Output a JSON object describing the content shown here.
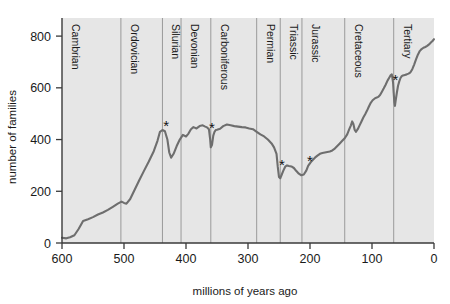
{
  "chart_data": {
    "type": "line",
    "title": "",
    "xlabel": "millions of years ago",
    "ylabel": "number of families",
    "xlim": [
      600,
      0
    ],
    "ylim": [
      0,
      870
    ],
    "x_reversed": true,
    "grid": false,
    "legend": null,
    "xticks": [
      600,
      500,
      400,
      300,
      200,
      100,
      0
    ],
    "xtick_labels": [
      "600",
      "500",
      "400",
      "300",
      "200",
      "100",
      "0"
    ],
    "yticks": [
      0,
      200,
      400,
      600,
      800
    ],
    "ytick_labels": [
      "0",
      "200",
      "400",
      "600",
      "800"
    ],
    "series": [
      {
        "name": "number of marine families",
        "color": "#6e6e6e",
        "points": [
          [
            600,
            20
          ],
          [
            593,
            18
          ],
          [
            587,
            22
          ],
          [
            580,
            30
          ],
          [
            573,
            55
          ],
          [
            566,
            85
          ],
          [
            558,
            92
          ],
          [
            550,
            100
          ],
          [
            542,
            110
          ],
          [
            534,
            118
          ],
          [
            526,
            128
          ],
          [
            518,
            140
          ],
          [
            510,
            152
          ],
          [
            504,
            160
          ],
          [
            500,
            155
          ],
          [
            496,
            152
          ],
          [
            490,
            170
          ],
          [
            483,
            205
          ],
          [
            476,
            240
          ],
          [
            468,
            278
          ],
          [
            460,
            315
          ],
          [
            452,
            355
          ],
          [
            446,
            395
          ],
          [
            442,
            430
          ],
          [
            438,
            437
          ],
          [
            434,
            432
          ],
          [
            430,
            400
          ],
          [
            427,
            350
          ],
          [
            424,
            330
          ],
          [
            420,
            345
          ],
          [
            415,
            375
          ],
          [
            410,
            400
          ],
          [
            405,
            418
          ],
          [
            400,
            412
          ],
          [
            396,
            423
          ],
          [
            392,
            440
          ],
          [
            388,
            448
          ],
          [
            383,
            443
          ],
          [
            378,
            452
          ],
          [
            373,
            455
          ],
          [
            369,
            450
          ],
          [
            366,
            447
          ],
          [
            363,
            440
          ],
          [
            361,
            400
          ],
          [
            360,
            370
          ],
          [
            358,
            380
          ],
          [
            356,
            415
          ],
          [
            354,
            430
          ],
          [
            352,
            437
          ],
          [
            350,
            438
          ],
          [
            345,
            442
          ],
          [
            340,
            452
          ],
          [
            334,
            458
          ],
          [
            328,
            455
          ],
          [
            322,
            452
          ],
          [
            316,
            450
          ],
          [
            310,
            448
          ],
          [
            304,
            447
          ],
          [
            298,
            443
          ],
          [
            292,
            440
          ],
          [
            286,
            430
          ],
          [
            280,
            420
          ],
          [
            274,
            412
          ],
          [
            268,
            400
          ],
          [
            262,
            385
          ],
          [
            258,
            370
          ],
          [
            254,
            345
          ],
          [
            252,
            295
          ],
          [
            250,
            255
          ],
          [
            248,
            250
          ],
          [
            246,
            262
          ],
          [
            243,
            280
          ],
          [
            240,
            295
          ],
          [
            237,
            300
          ],
          [
            234,
            298
          ],
          [
            230,
            296
          ],
          [
            226,
            290
          ],
          [
            222,
            278
          ],
          [
            218,
            268
          ],
          [
            214,
            262
          ],
          [
            210,
            265
          ],
          [
            206,
            280
          ],
          [
            203,
            298
          ],
          [
            201,
            305
          ],
          [
            199,
            312
          ],
          [
            196,
            320
          ],
          [
            192,
            330
          ],
          [
            188,
            338
          ],
          [
            184,
            345
          ],
          [
            180,
            348
          ],
          [
            176,
            350
          ],
          [
            172,
            352
          ],
          [
            168,
            354
          ],
          [
            164,
            358
          ],
          [
            160,
            365
          ],
          [
            156,
            375
          ],
          [
            152,
            385
          ],
          [
            148,
            395
          ],
          [
            144,
            405
          ],
          [
            140,
            420
          ],
          [
            137,
            438
          ],
          [
            134,
            455
          ],
          [
            132,
            470
          ],
          [
            130,
            460
          ],
          [
            128,
            438
          ],
          [
            126,
            430
          ],
          [
            123,
            440
          ],
          [
            120,
            455
          ],
          [
            117,
            470
          ],
          [
            114,
            485
          ],
          [
            111,
            498
          ],
          [
            108,
            512
          ],
          [
            105,
            528
          ],
          [
            102,
            542
          ],
          [
            99,
            552
          ],
          [
            96,
            558
          ],
          [
            93,
            562
          ],
          [
            90,
            565
          ],
          [
            87,
            572
          ],
          [
            84,
            585
          ],
          [
            81,
            598
          ],
          [
            78,
            612
          ],
          [
            75,
            628
          ],
          [
            72,
            640
          ],
          [
            70,
            648
          ],
          [
            68,
            652
          ],
          [
            66,
            620
          ],
          [
            65,
            580
          ],
          [
            64,
            545
          ],
          [
            63,
            530
          ],
          [
            62,
            548
          ],
          [
            60,
            580
          ],
          [
            58,
            608
          ],
          [
            56,
            625
          ],
          [
            54,
            638
          ],
          [
            52,
            645
          ],
          [
            50,
            648
          ],
          [
            47,
            650
          ],
          [
            44,
            652
          ],
          [
            41,
            655
          ],
          [
            38,
            660
          ],
          [
            35,
            672
          ],
          [
            32,
            690
          ],
          [
            29,
            710
          ],
          [
            26,
            728
          ],
          [
            23,
            742
          ],
          [
            20,
            750
          ],
          [
            17,
            755
          ],
          [
            14,
            758
          ],
          [
            11,
            762
          ],
          [
            8,
            768
          ],
          [
            5,
            775
          ],
          [
            2,
            782
          ],
          [
            0,
            788
          ]
        ]
      }
    ],
    "periods": [
      {
        "name": "Cambrian",
        "start": 600,
        "boundary": 600
      },
      {
        "name": "Ordovician",
        "start": 505,
        "boundary": 505
      },
      {
        "name": "Silurian",
        "start": 438,
        "boundary": 438
      },
      {
        "name": "Devonian",
        "start": 408,
        "boundary": 408
      },
      {
        "name": "Carboniferous",
        "start": 360,
        "boundary": 360
      },
      {
        "name": "Permian",
        "start": 286,
        "boundary": 286
      },
      {
        "name": "Triassic",
        "start": 248,
        "boundary": 248
      },
      {
        "name": "Jurassic",
        "start": 213,
        "boundary": 213
      },
      {
        "name": "Cretaceous",
        "start": 144,
        "boundary": 144
      },
      {
        "name": "Tertiary",
        "start": 65,
        "boundary": 65
      }
    ],
    "extinction_markers": [
      {
        "label": "*",
        "x": 437,
        "y": 437,
        "event": "end-Ordovician"
      },
      {
        "label": "*",
        "x": 363,
        "y": 430,
        "event": "Late Devonian"
      },
      {
        "label": "*",
        "x": 250,
        "y": 288,
        "event": "end-Permian"
      },
      {
        "label": "*",
        "x": 205,
        "y": 300,
        "event": "end-Triassic"
      },
      {
        "label": "*",
        "x": 67,
        "y": 615,
        "event": "end-Cretaceous"
      }
    ],
    "colors": {
      "line": "#6e6e6e",
      "plot_background": "#e6e6e6",
      "divider": "#9a9a9a",
      "axis": "#3a3a3a",
      "text": "#1a1a1a"
    }
  }
}
